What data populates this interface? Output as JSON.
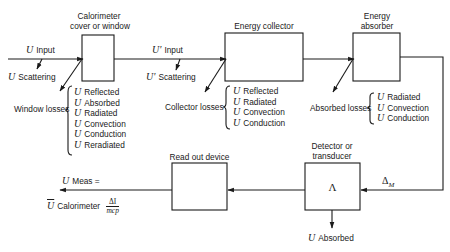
{
  "diagram": {
    "blocks": {
      "window": {
        "label": "Calorimeter\ncover or window",
        "label_line1": "Calorimeter",
        "label_line2": "cover or window"
      },
      "collector": {
        "label": "Energy collector"
      },
      "absorber": {
        "label": "Energy\nabsorber",
        "label_line1": "Energy",
        "label_line2": "absorber"
      },
      "detector": {
        "label_line1": "Detector or",
        "label_line2": "transducer",
        "symbol": "Λ"
      },
      "readout": {
        "label": "Read out device"
      }
    },
    "symbol_u": "U",
    "input": {
      "label": "Input"
    },
    "scattering": {
      "label": "Scattering"
    },
    "input_prime": {
      "symbol": "U'",
      "label": "Input"
    },
    "scattering_prime": {
      "symbol": "U'",
      "label": "Scattering"
    },
    "window_losses": {
      "label": "Window losses",
      "items": [
        "Reflected",
        "Absorbed",
        "Radiated",
        "Convection",
        "Conduction",
        "Reradiated"
      ]
    },
    "collector_losses": {
      "label": "Collector losses",
      "items": [
        "Reflected",
        "Radiated",
        "Convection",
        "Conduction"
      ]
    },
    "absorbed_losses": {
      "label": "Absorbed losses",
      "items": [
        "Radiated",
        "Convection",
        "Conduction"
      ]
    },
    "delta_m": {
      "symbol": "Δ",
      "subscript": "M"
    },
    "u_absorbed": {
      "label": "Absorbed"
    },
    "output": {
      "line1_label": "Meas =",
      "line2_label": "Calorimeter",
      "fraction_num": "ΔI",
      "fraction_den": "mcp"
    }
  }
}
